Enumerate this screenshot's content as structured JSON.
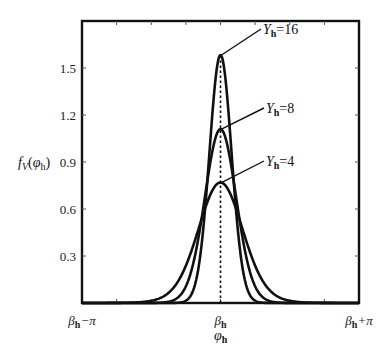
{
  "chart_data": {
    "type": "line",
    "title": "",
    "xlabel": "φh",
    "ylabel": "fV(φh)",
    "x_range_label": "[βh−π, βh+π]",
    "xlim": [
      -3.14159,
      3.14159
    ],
    "ylim": [
      0,
      1.8
    ],
    "x_ticks": [
      {
        "value": -3.14159,
        "label_main": "β",
        "label_sub": "h",
        "label_tail": "−π"
      },
      {
        "value": 0,
        "label_main": "β",
        "label_sub": "h",
        "label_tail": ""
      },
      {
        "value": 3.14159,
        "label_main": "β",
        "label_sub": "h",
        "label_tail": "+π"
      }
    ],
    "x_minor_tick_step": 0.785398,
    "y_ticks": [
      0.3,
      0.6,
      0.9,
      1.2,
      1.5
    ],
    "y_minor_ticks_right": [
      0.3,
      0.6,
      0.9,
      1.2,
      1.5
    ],
    "center_line": {
      "x": 0,
      "style": "dotted"
    },
    "distribution": "von Mises: exp(κ·cos x) / (2π·I0(κ))",
    "series": [
      {
        "name": "Yh=16",
        "label_main": "Y",
        "label_sub": "h",
        "label_tail": "=16",
        "kappa": 16,
        "peak": 1.59,
        "label_pos": [
          263,
          34
        ]
      },
      {
        "name": "Yh=8",
        "label_main": "Y",
        "label_sub": "h",
        "label_tail": "=8",
        "kappa": 8,
        "peak": 1.12,
        "label_pos": [
          266,
          113
        ]
      },
      {
        "name": "Yh=4",
        "label_main": "Y",
        "label_sub": "h",
        "label_tail": "=4",
        "kappa": 4,
        "peak": 0.77,
        "label_pos": [
          266,
          166
        ]
      }
    ],
    "grid": false,
    "legend": "inline annotations with leader lines",
    "colors": {
      "line": "#111111",
      "axis": "#111111",
      "background": "#ffffff"
    }
  },
  "axis": {
    "ylabel_main": "f",
    "ylabel_sub": "V",
    "ylabel_paren_open": "(",
    "ylabel_var": "φ",
    "ylabel_var_sub": "h",
    "ylabel_paren_close": ")",
    "xlabel_main": "φ",
    "xlabel_sub": "h"
  }
}
